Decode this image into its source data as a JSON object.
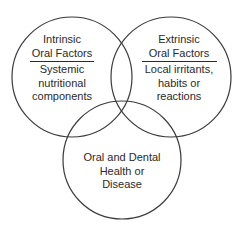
{
  "diagram": {
    "type": "venn",
    "stroke_color": "#3a3a3a",
    "text_color": "#2a2a2a",
    "circles": [
      {
        "id": "intrinsic",
        "heading": [
          "Intrinsic",
          "Oral Factors"
        ],
        "body": [
          "Systemic",
          "nutritional",
          "components"
        ]
      },
      {
        "id": "extrinsic",
        "heading": [
          "Extrinsic",
          "Oral Factors"
        ],
        "body": [
          "Local irritants,",
          "habits or",
          "reactions"
        ]
      },
      {
        "id": "outcome",
        "heading": [],
        "body": [
          "Oral and Dental",
          "Health or",
          "Disease"
        ]
      }
    ]
  }
}
